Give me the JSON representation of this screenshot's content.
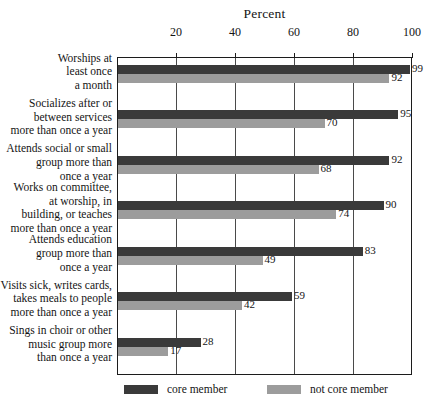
{
  "chart_data": {
    "type": "bar",
    "orientation": "horizontal",
    "title": "Percent",
    "xlabel": "",
    "ylabel": "",
    "xlim": [
      0,
      100
    ],
    "xticks": [
      20,
      40,
      60,
      80,
      100
    ],
    "grid": true,
    "legend_position": "bottom",
    "categories": [
      "Worships at\nleast once\na month",
      "Socializes after or\nbetween services\nmore than once a year",
      "Attends social or small\ngroup more than\nonce a year",
      "Works on committee,\nat worship, in\nbuilding, or teaches\nmore than once a year",
      "Attends education\ngroup more than\nonce a year",
      "Visits sick, writes cards,\ntakes meals to people\nmore than once a year",
      "Sings in choir or other\nmusic group more\nthan once a year"
    ],
    "series": [
      {
        "name": "core member",
        "color": "#3a3a3a",
        "values": [
          99,
          95,
          92,
          90,
          83,
          59,
          28
        ]
      },
      {
        "name": "not core member",
        "color": "#9c9c9c",
        "values": [
          92,
          70,
          68,
          74,
          49,
          42,
          17
        ]
      }
    ]
  },
  "legend": {
    "items": [
      {
        "label": "core member",
        "swatch": "core"
      },
      {
        "label": "not core member",
        "swatch": "noncore"
      }
    ]
  }
}
